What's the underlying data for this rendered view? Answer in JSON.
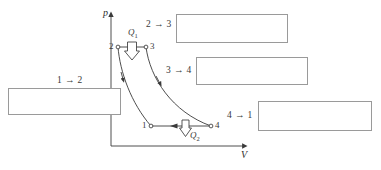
{
  "diagram": {
    "type": "pressure-volume-cycle",
    "axes": {
      "y_label": "p",
      "x_label": "V"
    },
    "points": [
      {
        "id": "2",
        "label": "2",
        "x": 118,
        "y": 47
      },
      {
        "id": "3",
        "label": "3",
        "x": 146,
        "y": 47
      },
      {
        "id": "1",
        "label": "1",
        "x": 151,
        "y": 126
      },
      {
        "id": "4",
        "label": "4",
        "x": 211,
        "y": 126
      }
    ],
    "heat_flows": [
      {
        "id": "Q1",
        "label": "Q",
        "sub": "1",
        "direction": "down"
      },
      {
        "id": "Q2",
        "label": "Q",
        "sub": "2",
        "direction": "down"
      }
    ],
    "processes": [
      {
        "id": "1-2",
        "label": "1 → 2"
      },
      {
        "id": "2-3",
        "label": "2 → 3"
      },
      {
        "id": "3-4",
        "label": "3 → 4"
      },
      {
        "id": "4-1",
        "label": "4 → 1"
      }
    ],
    "answers": {
      "box_1_2": "",
      "box_2_3": "",
      "box_3_4": "",
      "box_4_1": ""
    },
    "colors": {
      "line": "#3a3a3a",
      "box_border": "#9a9a9a",
      "background": "#ffffff"
    }
  }
}
